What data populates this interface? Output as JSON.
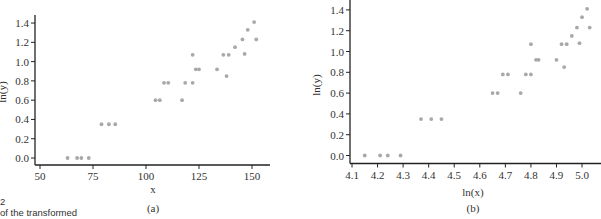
{
  "chart_data": [
    {
      "type": "scatter",
      "panel_label": "(a)",
      "xlabel": "x",
      "ylabel": "ln(y)",
      "xlim": [
        47,
        155
      ],
      "ylim": [
        -0.07,
        1.47
      ],
      "x_ticks": [
        50,
        75,
        100,
        125,
        150
      ],
      "y_ticks": [
        0.0,
        0.2,
        0.4,
        0.6,
        0.8,
        1.0,
        1.2,
        1.4
      ],
      "x_tick_labels": [
        "50",
        "75",
        "100",
        "125",
        "150"
      ],
      "y_tick_labels": [
        "0.0",
        "0.2",
        "0.4",
        "0.6",
        "0.8",
        "1.0",
        "1.2",
        "1.4"
      ],
      "grid": false,
      "marker_color": "#a8a8a8",
      "points": [
        {
          "x": 63,
          "y": 0.0
        },
        {
          "x": 67.5,
          "y": 0.0
        },
        {
          "x": 69.5,
          "y": 0.0
        },
        {
          "x": 73,
          "y": 0.0
        },
        {
          "x": 79,
          "y": 0.35
        },
        {
          "x": 82.5,
          "y": 0.35
        },
        {
          "x": 85.5,
          "y": 0.35
        },
        {
          "x": 104.5,
          "y": 0.6
        },
        {
          "x": 106.5,
          "y": 0.6
        },
        {
          "x": 117,
          "y": 0.6
        },
        {
          "x": 108.5,
          "y": 0.78
        },
        {
          "x": 110.5,
          "y": 0.78
        },
        {
          "x": 118.5,
          "y": 0.78
        },
        {
          "x": 122,
          "y": 0.78
        },
        {
          "x": 123.5,
          "y": 0.92
        },
        {
          "x": 125,
          "y": 0.92
        },
        {
          "x": 133.5,
          "y": 0.92
        },
        {
          "x": 122,
          "y": 1.07
        },
        {
          "x": 136.5,
          "y": 1.07
        },
        {
          "x": 139,
          "y": 1.07
        },
        {
          "x": 138,
          "y": 0.85
        },
        {
          "x": 142,
          "y": 1.15
        },
        {
          "x": 145.5,
          "y": 1.23
        },
        {
          "x": 152,
          "y": 1.23
        },
        {
          "x": 146.5,
          "y": 1.08
        },
        {
          "x": 148,
          "y": 1.33
        },
        {
          "x": 151,
          "y": 1.41
        }
      ]
    },
    {
      "type": "scatter",
      "panel_label": "(b)",
      "xlabel": "ln(x)",
      "ylabel": "ln(y)",
      "xlim": [
        4.08,
        5.06
      ],
      "ylim": [
        -0.07,
        1.47
      ],
      "x_ticks": [
        4.1,
        4.2,
        4.3,
        4.4,
        4.5,
        4.6,
        4.7,
        4.8,
        4.9,
        5.0
      ],
      "y_ticks": [
        0.0,
        0.2,
        0.4,
        0.6,
        0.8,
        1.0,
        1.2,
        1.4
      ],
      "x_tick_labels": [
        "4.1",
        "4.2",
        "4.3",
        "4.4",
        "4.5",
        "4.6",
        "4.7",
        "4.8",
        "4.9",
        "5.0"
      ],
      "y_tick_labels": [
        "0.0",
        "0.2",
        "0.4",
        "0.6",
        "0.8",
        "1.0",
        "1.2",
        "1.4"
      ],
      "grid": false,
      "marker_color": "#a8a8a8",
      "points": [
        {
          "x": 4.15,
          "y": 0.0
        },
        {
          "x": 4.21,
          "y": 0.0
        },
        {
          "x": 4.24,
          "y": 0.0
        },
        {
          "x": 4.29,
          "y": 0.0
        },
        {
          "x": 4.37,
          "y": 0.35
        },
        {
          "x": 4.41,
          "y": 0.35
        },
        {
          "x": 4.45,
          "y": 0.35
        },
        {
          "x": 4.65,
          "y": 0.6
        },
        {
          "x": 4.67,
          "y": 0.6
        },
        {
          "x": 4.76,
          "y": 0.6
        },
        {
          "x": 4.69,
          "y": 0.78
        },
        {
          "x": 4.71,
          "y": 0.78
        },
        {
          "x": 4.78,
          "y": 0.78
        },
        {
          "x": 4.8,
          "y": 0.78
        },
        {
          "x": 4.82,
          "y": 0.92
        },
        {
          "x": 4.83,
          "y": 0.92
        },
        {
          "x": 4.9,
          "y": 0.92
        },
        {
          "x": 4.8,
          "y": 1.07
        },
        {
          "x": 4.92,
          "y": 1.07
        },
        {
          "x": 4.94,
          "y": 1.07
        },
        {
          "x": 4.93,
          "y": 0.85
        },
        {
          "x": 4.96,
          "y": 1.15
        },
        {
          "x": 4.98,
          "y": 1.23
        },
        {
          "x": 5.03,
          "y": 1.23
        },
        {
          "x": 4.99,
          "y": 1.08
        },
        {
          "x": 5.0,
          "y": 1.33
        },
        {
          "x": 5.02,
          "y": 1.41
        }
      ]
    }
  ],
  "page": {
    "cropped_caption_number": "2",
    "cropped_caption_text": "of the transformed"
  }
}
